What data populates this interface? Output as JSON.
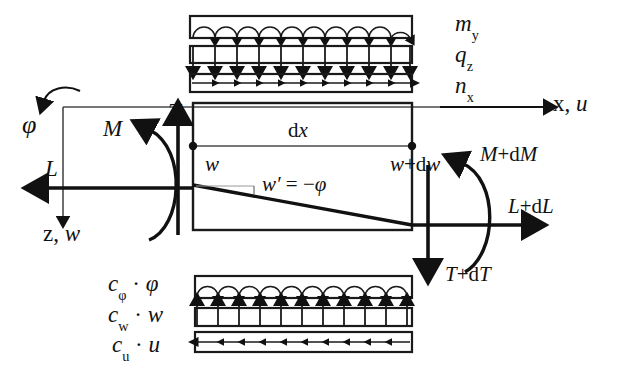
{
  "figure": {
    "type": "engineering-free-body-diagram"
  },
  "top_loads": [
    {
      "id": "my",
      "base": "m",
      "sub": "y",
      "marker": "arc-arrow-down",
      "box": true
    },
    {
      "id": "qz",
      "base": "q",
      "sub": "z",
      "marker": "arrow-down",
      "box": true
    },
    {
      "id": "nx",
      "base": "n",
      "sub": "x",
      "marker": "arrow-right",
      "box": true
    }
  ],
  "bottom_loads": [
    {
      "id": "cphi",
      "base": "c",
      "sub": "φ",
      "factor": "·",
      "variable": "φ",
      "marker": "arc-arrow-up",
      "box": true
    },
    {
      "id": "cw",
      "base": "c",
      "sub": "w",
      "factor": "·",
      "variable": "w",
      "marker": "arrow-up",
      "box": true
    },
    {
      "id": "cu",
      "base": "c",
      "sub": "u",
      "factor": "·",
      "variable": "u",
      "marker": "arrow-left",
      "box": true
    }
  ],
  "axes": {
    "x_axis_label_base": "x, ",
    "x_axis_label_var": "u",
    "z_axis_label_base": "z, ",
    "z_axis_label_var": "w",
    "rotation_label": "φ"
  },
  "left_forces": {
    "moment": "M",
    "normal": "L",
    "shear": "T"
  },
  "right_forces": {
    "moment_base": "M",
    "moment_inc": "+d",
    "moment_sym": "M",
    "normal_base": "L",
    "normal_inc": "+d",
    "normal_sym": "L",
    "shear_base": "T",
    "shear_inc": "+d",
    "shear_sym": "T"
  },
  "element": {
    "length_label_d": "d",
    "length_label_x": "x",
    "deflection_left": "w",
    "deflection_right_base": "w",
    "deflection_right_inc": "+d",
    "deflection_right_sym": "w",
    "slope_relation_w": "w",
    "slope_relation_prime": "′",
    "slope_relation_eq": " = −",
    "slope_relation_phi": "φ"
  },
  "colors": {
    "ink": "#111111",
    "line": "#1a1a1a",
    "thin": "#4a4a4a",
    "background": "#ffffff"
  }
}
